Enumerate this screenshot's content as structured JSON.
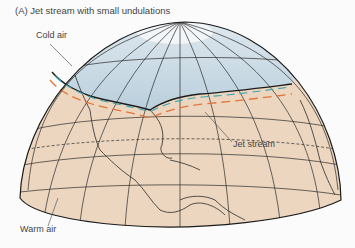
{
  "figure": {
    "title": "(A) Jet stream with small undulations",
    "labels": {
      "cold_air": "Cold air",
      "jet_stream": "Jet stream",
      "warm_air": "Warm air"
    },
    "colors": {
      "cold_region": "#c9d8e3",
      "warm_region": "#ecd6bf",
      "jet_stream_arrow": "#e2763b",
      "cold_boundary_arrow": "#3aa6b4",
      "outline": "#2b2b2b"
    }
  }
}
